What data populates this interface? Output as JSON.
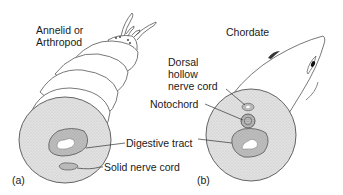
{
  "figure": {
    "panels": [
      {
        "id": "a",
        "panel_label": "(a)",
        "title": "Annelid or\nArthropod",
        "labels": {
          "digestive_tract": "Digestive tract",
          "solid_nerve_cord": "Solid nerve cord"
        }
      },
      {
        "id": "b",
        "panel_label": "(b)",
        "title": "Chordate",
        "labels": {
          "dorsal_hollow_nerve_cord": "Dorsal\nhollow\nnerve cord",
          "notochord": "Notochord"
        }
      }
    ],
    "colors": {
      "outline": "#555555",
      "body_fill": "#ffffff",
      "cross_section": "#dcdcdc",
      "tract_ring": "#b4b4b4",
      "lumen": "#ffffff",
      "leader": "#333333"
    }
  }
}
